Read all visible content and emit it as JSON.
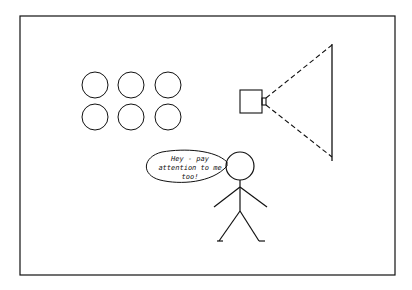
{
  "diagram": {
    "speech_bubble": {
      "lines": [
        "Hey - pay",
        "attention to me",
        "too!"
      ]
    },
    "elements": {
      "circle_grid": {
        "rows": 2,
        "cols": 3
      },
      "projector": "camera-box-with-dashed-beam",
      "screen": "vertical-line",
      "figure": "stick-person"
    },
    "colors": {
      "stroke": "#111111",
      "background": "#ffffff"
    }
  }
}
